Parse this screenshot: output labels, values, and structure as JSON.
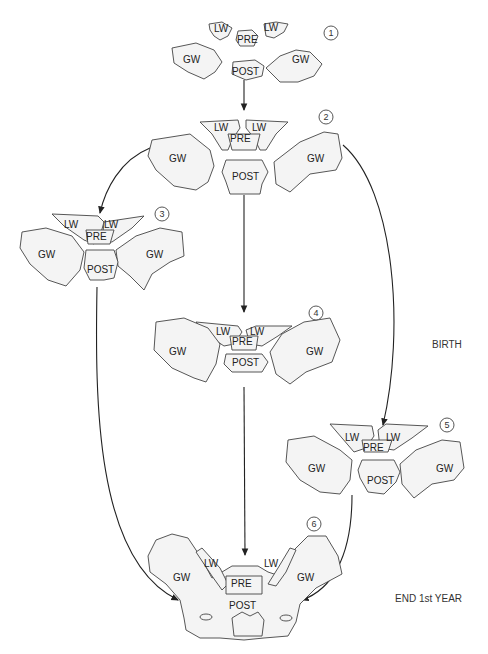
{
  "diagram": {
    "title": "",
    "side_labels": {
      "birth": "BIRTH",
      "end_first_year": "END 1st YEAR"
    },
    "stages": [
      {
        "number": "1",
        "labels": {
          "lw_left": "LW",
          "lw_right": "LW",
          "pre": "PRE",
          "post": "POST",
          "gw_left": "GW",
          "gw_right": "GW"
        }
      },
      {
        "number": "2",
        "labels": {
          "lw_left": "LW",
          "lw_right": "LW",
          "pre": "PRE",
          "post": "POST",
          "gw_left": "GW",
          "gw_right": "GW"
        }
      },
      {
        "number": "3",
        "labels": {
          "lw_left": "LW",
          "lw_right": "LW",
          "pre": "PRE",
          "post": "POST",
          "gw_left": "GW",
          "gw_right": "GW"
        }
      },
      {
        "number": "4",
        "labels": {
          "lw_left": "LW",
          "lw_right": "LW",
          "pre": "PRE",
          "post": "POST",
          "gw_left": "GW",
          "gw_right": "GW"
        }
      },
      {
        "number": "5",
        "labels": {
          "lw_left": "LW",
          "lw_right": "LW",
          "pre": "PRE",
          "post": "POST",
          "gw_left": "GW",
          "gw_right": "GW"
        }
      },
      {
        "number": "6",
        "labels": {
          "lw_left": "LW",
          "lw_right": "LW",
          "pre": "PRE",
          "post": "POST",
          "gw_left": "GW",
          "gw_right": "GW"
        }
      }
    ],
    "connections": [
      {
        "from": "1",
        "to": "2"
      },
      {
        "from": "2",
        "to": "3"
      },
      {
        "from": "2",
        "to": "4"
      },
      {
        "from": "2",
        "to": "5"
      },
      {
        "from": "3",
        "to": "6"
      },
      {
        "from": "4",
        "to": "6"
      },
      {
        "from": "5",
        "to": "6"
      }
    ]
  }
}
